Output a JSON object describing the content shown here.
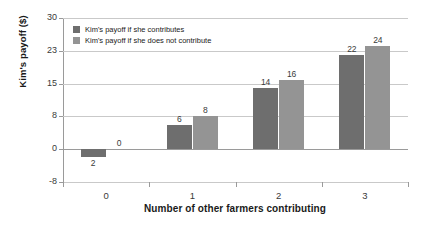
{
  "chart_data": {
    "type": "bar",
    "title": "",
    "subtitle": "",
    "xlabel": "Number of other farmers contributing",
    "ylabel": "Kim's payoff ($)",
    "categories": [
      "0",
      "1",
      "2",
      "3"
    ],
    "series": [
      {
        "name": "Kim's payoff if she contributes",
        "color": "#6e6e6e",
        "values": [
          -2,
          6,
          14,
          22
        ],
        "data_labels": [
          "2",
          "6",
          "14",
          "22"
        ]
      },
      {
        "name": "Kim's payoff if she does not contribute",
        "color": "#949494",
        "values": [
          0,
          8,
          16,
          24
        ],
        "data_labels": [
          "0",
          "8",
          "16",
          "24"
        ]
      }
    ],
    "ylim": [
      -8,
      30
    ],
    "ytick_labels": [
      "30",
      "23",
      "15",
      "8",
      "0",
      "-8"
    ],
    "ytick_values": [
      30,
      23,
      15,
      8,
      0,
      -8
    ],
    "grid": true,
    "legend_position": "top-left"
  },
  "legend": {
    "items": [
      {
        "label": "Kim's payoff if she contributes",
        "color": "#6e6e6e"
      },
      {
        "label": "Kim's payoff if she does not contribute",
        "color": "#949494"
      }
    ]
  },
  "colors": {
    "series_dark": "#6e6e6e",
    "series_light": "#949494",
    "gridline": "#c9c9c9",
    "axis": "#9a9a9a",
    "text": "#1a1a1a",
    "background": "#ffffff"
  }
}
